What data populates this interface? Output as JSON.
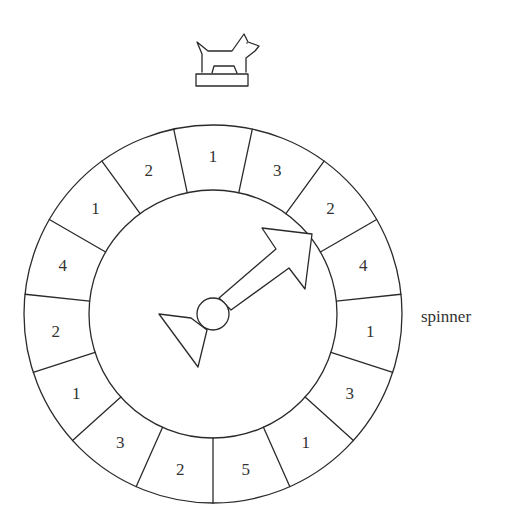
{
  "diagram": {
    "caption": "spinner",
    "token": "dog-game-piece",
    "segments": [
      "1",
      "3",
      "2",
      "4",
      "1",
      "3",
      "1",
      "5",
      "2",
      "3",
      "1",
      "2",
      "4",
      "1",
      "2"
    ],
    "segment_order": "clockwise starting from top",
    "pointer_direction": "upper-right, toward segment labeled 2"
  }
}
